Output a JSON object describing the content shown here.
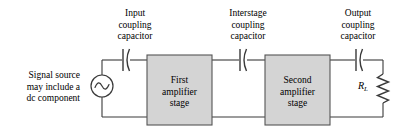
{
  "figure": {
    "background": "#ffffff",
    "line_color": "#3a3a3a",
    "block_fill": "#d4d4d4",
    "block_stroke": "#555555",
    "text_color": "#000000",
    "width": 400,
    "height": 133
  },
  "annotations": {
    "input_coupling_capacitor": {
      "line1": "Input",
      "line2": "coupling",
      "line3": "capacitor"
    },
    "interstage_coupling_capacitor": {
      "line1": "Interstage",
      "line2": "coupling",
      "line3": "capacitor"
    },
    "output_coupling_capacitor": {
      "line1": "Output",
      "line2": "coupling",
      "line3": "capacitor"
    },
    "signal_source": {
      "line1": "Signal source",
      "line2": "may include a",
      "line3": "dc component"
    }
  },
  "blocks": {
    "first_stage": {
      "line1": "First",
      "line2": "amplifier",
      "line3": "stage"
    },
    "second_stage": {
      "line1": "Second",
      "line2": "amplifier",
      "line3": "stage"
    }
  },
  "components": {
    "load_resistor": {
      "symbol": "R",
      "subscript": "L"
    },
    "source_symbol": "ac-sine-source",
    "capacitor_symbol": "polarized-coupling-capacitor",
    "resistor_symbol": "zigzag-resistor"
  }
}
